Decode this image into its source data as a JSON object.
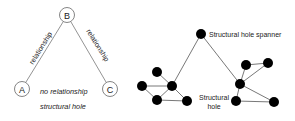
{
  "left_diagram": {
    "nodes": [
      {
        "id": "A",
        "label": "A",
        "x": 22,
        "y": 89
      },
      {
        "id": "B",
        "label": "B",
        "x": 67,
        "y": 15
      },
      {
        "id": "C",
        "label": "C",
        "x": 110,
        "y": 89
      }
    ],
    "edge_labels": {
      "ab": "relationship",
      "bc": "relationship"
    },
    "caption_line1": "no relationship",
    "caption_line2": "structural hole"
  },
  "right_diagram": {
    "spanner_label": "Structural hole spanner",
    "hole_label_line1": "Structural",
    "hole_label_line2": "hole"
  },
  "colors": {
    "node_fill": "#000000",
    "edge": "#555555",
    "circle_stroke": "#666666"
  }
}
